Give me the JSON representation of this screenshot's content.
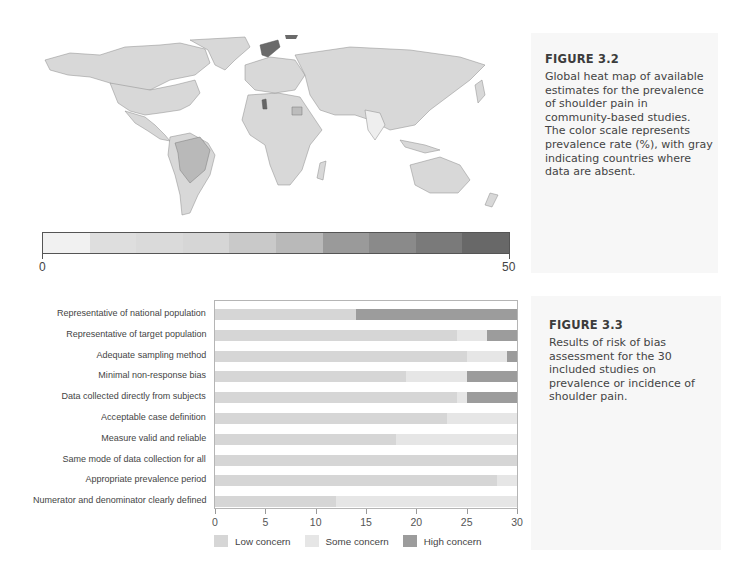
{
  "figure_3_2": {
    "title": "FIGURE 3.2",
    "caption": "Global heat map of available estimates for the prevalence of shoulder pain in community-based studies. The color scale represents prevalence rate (%), with gray indicating countries where data are absent.",
    "scale": {
      "min_label": "0",
      "max_label": "50",
      "colors": [
        "#f1f1f1",
        "#dedede",
        "#dadada",
        "#d6d6d6",
        "#c9c9c9",
        "#b9b9b9",
        "#9a9a9a",
        "#8a8a8a",
        "#7a7a7a",
        "#686868"
      ]
    }
  },
  "figure_3_3": {
    "title": "FIGURE 3.3",
    "caption": "Results of risk of bias assessment for the 30 included studies on prevalence or incidence of shoulder pain."
  },
  "colors": {
    "low": "#d6d6d6",
    "some": "#e6e6e6",
    "high": "#9c9c9c",
    "panel_bg": "#f7f7f7"
  },
  "chart_data": [
    {
      "type": "map",
      "title": "Global heat map of shoulder pain prevalence",
      "legend": {
        "type": "continuous-binned",
        "min": 0,
        "max": 50,
        "unit": "%",
        "bins": 10
      },
      "highlighted_regions": [
        "Norway (dark)",
        "Tunisia (dark)",
        "Brazil (medium)",
        "India (light)",
        "Egypt (medium)",
        "Senegal (medium)"
      ]
    },
    {
      "type": "bar",
      "stacked": true,
      "orientation": "horizontal",
      "title": "Risk of bias assessment",
      "xlabel": "",
      "ylabel": "",
      "xlim": [
        0,
        30
      ],
      "xticks": [
        "0",
        "5",
        "10",
        "15",
        "20",
        "25",
        "30"
      ],
      "categories": [
        "Representative of national population",
        "Representative of target population",
        "Adequate sampling method",
        "Minimal non-response bias",
        "Data collected directly from subjects",
        "Acceptable case definition",
        "Measure valid and reliable",
        "Same mode of data collection for all",
        "Appropriate prevalence period",
        "Numerator and denominator clearly defined"
      ],
      "series": [
        {
          "name": "Low concern",
          "values": [
            14,
            24,
            25,
            19,
            24,
            23,
            18,
            30,
            28,
            12
          ]
        },
        {
          "name": "Some concern",
          "values": [
            0,
            3,
            4,
            6,
            1,
            7,
            12,
            0,
            2,
            18
          ]
        },
        {
          "name": "High concern",
          "values": [
            16,
            3,
            1,
            5,
            5,
            0,
            0,
            0,
            0,
            0
          ]
        }
      ],
      "legend_position": "bottom"
    }
  ]
}
